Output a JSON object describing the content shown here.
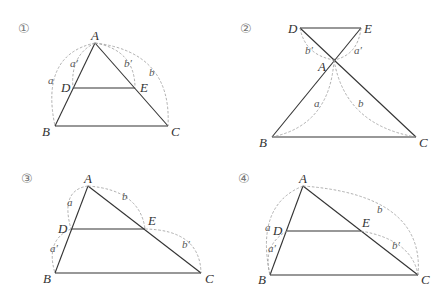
{
  "figures": [
    {
      "number": "①",
      "points": {
        "A": "A",
        "B": "B",
        "C": "C",
        "D": "D",
        "E": "E"
      },
      "segments": {
        "a": "a",
        "a_prime": "a′",
        "b": "b",
        "b_prime": "b′"
      }
    },
    {
      "number": "②",
      "points": {
        "A": "A",
        "B": "B",
        "C": "C",
        "D": "D",
        "E": "E"
      },
      "segments": {
        "a": "a",
        "a_prime": "a′",
        "b": "b",
        "b_prime": "b′"
      }
    },
    {
      "number": "③",
      "points": {
        "A": "A",
        "B": "B",
        "C": "C",
        "D": "D",
        "E": "E"
      },
      "segments": {
        "a": "a",
        "a_prime": "a′",
        "b": "b",
        "b_prime": "b′"
      }
    },
    {
      "number": "④",
      "points": {
        "A": "A",
        "B": "B",
        "C": "C",
        "D": "D",
        "E": "E"
      },
      "segments": {
        "a": "a",
        "a_prime": "a′",
        "b": "b",
        "b_prime": "b′"
      }
    }
  ],
  "colors": {
    "line": "#333333",
    "dashed": "#9a9a9a",
    "label": "#333333"
  }
}
